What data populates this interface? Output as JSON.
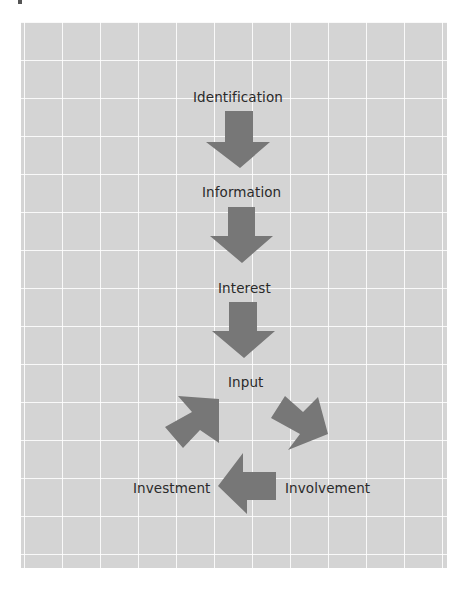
{
  "diagram": {
    "steps": [
      {
        "label": "Identification"
      },
      {
        "label": "Information"
      },
      {
        "label": "Interest"
      },
      {
        "label": "Input"
      }
    ],
    "cycle": [
      {
        "label": "Involvement"
      },
      {
        "label": "Investment"
      }
    ],
    "colors": {
      "background": "#d4d4d4",
      "grid": "#ffffff",
      "arrow": "#777777",
      "text": "#2a2a2a"
    }
  }
}
